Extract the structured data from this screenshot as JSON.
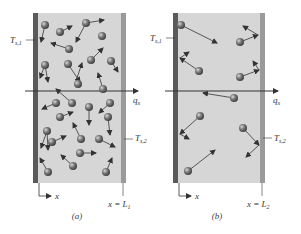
{
  "panels": [
    {
      "id": "a",
      "caption": "(a)",
      "left_label": "T",
      "left_label_sub": "s,1",
      "right_label": "T",
      "right_label_sub": "s,2",
      "flux_label": "q",
      "flux_label_sub": "x",
      "axis_label": "x",
      "boundary_label": "x = L",
      "boundary_label_sub": "1"
    },
    {
      "id": "b",
      "caption": "(b)",
      "left_label": "T",
      "left_label_sub": "s,1",
      "right_label": "T",
      "right_label_sub": "s,2",
      "flux_label": "q",
      "flux_label_sub": "x",
      "axis_label": "x",
      "boundary_label": "x = L",
      "boundary_label_sub": "2"
    }
  ],
  "colors": {
    "hot_wall": "#5a5a5a",
    "cold_wall": "#9a9a9a",
    "gas_fill": "#d6d6d6",
    "molecule": "#6b6b6b",
    "arrow": "#333333"
  }
}
